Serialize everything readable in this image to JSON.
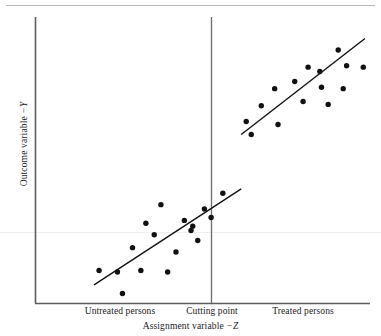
{
  "figure": {
    "title": "",
    "background_color": "#ffffff",
    "ink_color": "#1a1a1a"
  },
  "axes": {
    "x_title_prefix": "Assignment variable ",
    "x_title_var": "−Z",
    "y_title_prefix": "Outcome variable ",
    "y_title_var": "−Y"
  },
  "regions": {
    "untreated_label": "Untreated persons",
    "cutting_label": "Cutting point",
    "treated_label": "Treated persons"
  },
  "chart_data": {
    "type": "scatter",
    "title": "",
    "xlabel": "Assignment variable −Z",
    "ylabel": "Outcome variable −Y",
    "grid": false,
    "legend": "none",
    "axis_ticks": "none",
    "xlim": [
      0,
      100
    ],
    "ylim": [
      0,
      100
    ],
    "cutoff": {
      "x": 61.5,
      "label": "Cutting point",
      "line_style": "solid",
      "color": "#555555"
    },
    "annotations": [
      {
        "text": "Untreated persons",
        "x": 26,
        "y": -7,
        "group": "control"
      },
      {
        "text": "Cutting point",
        "x": 61.5,
        "y": -7,
        "group": "cutoff"
      },
      {
        "text": "Treated persons",
        "x": 84,
        "y": -7,
        "group": "treated"
      }
    ],
    "series": [
      {
        "name": "Untreated persons",
        "group": "control",
        "marker": "filled-circle",
        "color": "#111111",
        "points": [
          {
            "x": 19.0,
            "y": 11.5
          },
          {
            "x": 24.5,
            "y": 11.0
          },
          {
            "x": 26.0,
            "y": 3.5
          },
          {
            "x": 29.0,
            "y": 19.5
          },
          {
            "x": 31.5,
            "y": 11.5
          },
          {
            "x": 33.0,
            "y": 28.0
          },
          {
            "x": 35.5,
            "y": 24.0
          },
          {
            "x": 37.5,
            "y": 34.5
          },
          {
            "x": 39.5,
            "y": 11.0
          },
          {
            "x": 42.0,
            "y": 18.0
          },
          {
            "x": 44.5,
            "y": 29.0
          },
          {
            "x": 46.5,
            "y": 25.5
          },
          {
            "x": 47.0,
            "y": 27.0
          },
          {
            "x": 48.5,
            "y": 22.0
          },
          {
            "x": 50.5,
            "y": 33.0
          },
          {
            "x": 52.5,
            "y": 30.0
          },
          {
            "x": 56.0,
            "y": 38.5
          }
        ]
      },
      {
        "name": "Treated persons",
        "group": "treated",
        "marker": "filled-circle",
        "color": "#111111",
        "points": [
          {
            "x": 63.0,
            "y": 63.5
          },
          {
            "x": 64.5,
            "y": 59.0
          },
          {
            "x": 67.5,
            "y": 69.0
          },
          {
            "x": 72.5,
            "y": 62.5
          },
          {
            "x": 71.5,
            "y": 75.0
          },
          {
            "x": 77.5,
            "y": 77.5
          },
          {
            "x": 80.0,
            "y": 70.5
          },
          {
            "x": 81.5,
            "y": 82.5
          },
          {
            "x": 85.0,
            "y": 81.0
          },
          {
            "x": 85.5,
            "y": 75.5
          },
          {
            "x": 87.5,
            "y": 69.5
          },
          {
            "x": 90.5,
            "y": 88.5
          },
          {
            "x": 92.0,
            "y": 75.0
          },
          {
            "x": 93.0,
            "y": 83.0
          },
          {
            "x": 98.0,
            "y": 82.5
          }
        ]
      }
    ],
    "fit_lines": [
      {
        "name": "Untreated regression line",
        "group": "control",
        "x_start": 17.5,
        "y_start": 6.5,
        "x_end": 61.5,
        "y_end": 40.0,
        "color": "#111111"
      },
      {
        "name": "Treated regression line",
        "group": "treated",
        "x_start": 61.5,
        "y_start": 59.0,
        "x_end": 98.5,
        "y_end": 92.5,
        "color": "#111111"
      }
    ],
    "discontinuity": {
      "at_cutoff_control_y": 40.0,
      "at_cutoff_treated_y": 59.0,
      "jump": 19.0
    }
  }
}
